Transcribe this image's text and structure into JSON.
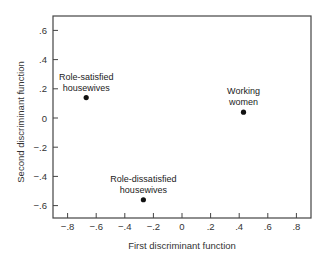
{
  "chart_data": {
    "type": "scatter",
    "title": "",
    "xlabel": "First discriminant function",
    "ylabel": "Second discriminant function",
    "xlim": [
      -0.9,
      0.9
    ],
    "ylim": [
      -0.7,
      0.7
    ],
    "x_ticks": [
      -0.8,
      -0.6,
      -0.4,
      -0.2,
      0,
      0.2,
      0.4,
      0.6,
      0.8
    ],
    "x_tick_labels": [
      "−.8",
      "−.6",
      "−.4",
      "−.2",
      "0",
      ".2",
      ".4",
      ".6",
      ".8"
    ],
    "y_ticks": [
      0.6,
      0.4,
      0.2,
      0,
      -0.2,
      -0.4,
      -0.6
    ],
    "y_tick_labels": [
      ".6",
      ".4",
      ".2",
      "0",
      "−.2",
      "−.4",
      "−.6"
    ],
    "grid": false,
    "legend": null,
    "points": [
      {
        "label_line1": "Role-satisfied",
        "label_line2": "housewives",
        "x": -0.67,
        "y": 0.14
      },
      {
        "label_line1": "Role-dissatisfied",
        "label_line2": "housewives",
        "x": -0.27,
        "y": -0.56
      },
      {
        "label_line1": "Working",
        "label_line2": "women",
        "x": 0.43,
        "y": 0.04
      }
    ]
  },
  "colors": {
    "axis": "#444444",
    "point": "#111111",
    "background": "#ffffff"
  }
}
